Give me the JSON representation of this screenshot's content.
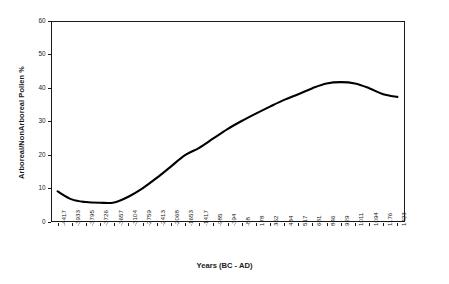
{
  "chart_data": {
    "type": "line",
    "title": "",
    "xlabel": "Years (BC - AD)",
    "ylabel": "Arboreal/NonArboreal Pollen %",
    "ylim": [
      0,
      60
    ],
    "yticks": [
      0,
      10,
      20,
      30,
      40,
      50,
      60
    ],
    "grid": false,
    "legend": null,
    "line_color": "#000000",
    "frame_color": "#1a1a1a",
    "categories": [
      "-4417",
      "-3933",
      "-3795",
      "-3726",
      "-3657",
      "-3104",
      "-2759",
      "-2413",
      "-2068",
      "-1653",
      "-1417",
      "-985",
      "-394",
      "-88",
      "178",
      "352",
      "434",
      "517",
      "681",
      "846",
      "929",
      "1011",
      "1094",
      "1176",
      "1423"
    ],
    "values": [
      9.0,
      6.6,
      5.8,
      5.6,
      5.7,
      7.4,
      9.9,
      13.0,
      16.4,
      19.8,
      22.0,
      24.8,
      27.6,
      30.0,
      32.2,
      34.3,
      36.3,
      38.0,
      39.8,
      41.2,
      41.6,
      41.2,
      39.8,
      38.0,
      37.2
    ],
    "series": [
      {
        "name": "Arboreal/NonArboreal Pollen %",
        "values": [
          9.0,
          6.6,
          5.8,
          5.6,
          5.7,
          7.4,
          9.9,
          13.0,
          16.4,
          19.8,
          22.0,
          24.8,
          27.6,
          30.0,
          32.2,
          34.3,
          36.3,
          38.0,
          39.8,
          41.2,
          41.6,
          41.2,
          39.8,
          38.0,
          37.2
        ]
      }
    ]
  }
}
